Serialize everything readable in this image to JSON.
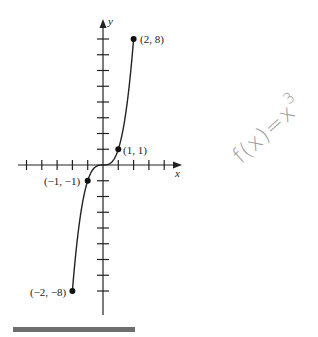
{
  "chart_data": {
    "type": "line",
    "title": "",
    "xlabel": "x",
    "ylabel": "y",
    "function": "f(x) = x^3",
    "domain": [
      -2,
      2
    ],
    "xlim": [
      -5.2,
      4.9
    ],
    "ylim": [
      -9.5,
      9.2
    ],
    "grid": false,
    "x_ticks": [
      -5,
      -4,
      -3,
      -2,
      -1,
      1,
      2,
      3,
      4
    ],
    "y_ticks": [
      -8,
      -7,
      -6,
      -5,
      -4,
      -3,
      -2,
      -1,
      1,
      2,
      3,
      4,
      5,
      6,
      7,
      8
    ],
    "series": [
      {
        "name": "f(x) = x^3",
        "x": [
          -2,
          -1.5,
          -1,
          -0.5,
          0,
          0.5,
          1,
          1.5,
          2
        ],
        "y": [
          -8,
          -3.375,
          -1,
          -0.125,
          0,
          0.125,
          1,
          3.375,
          8
        ]
      }
    ],
    "points": [
      {
        "x": 2,
        "y": 8,
        "label": "(2, 8)"
      },
      {
        "x": 1,
        "y": 1,
        "label": "(1, 1)"
      },
      {
        "x": -1,
        "y": -1,
        "label": "(−1, −1)"
      },
      {
        "x": -2,
        "y": -8,
        "label": "(−2, −8)"
      }
    ],
    "annotations": [
      {
        "text": "f(x)=x",
        "superscript": "3",
        "style": "handwritten pencil, rotated"
      }
    ]
  },
  "labels": {
    "x_axis": "x",
    "y_axis": "y",
    "p1": "(2, 8)",
    "p2": "(1, 1)",
    "p3": "(−1, −1)",
    "p4": "(−2, −8)",
    "handwritten": "f(x)=x",
    "handwritten_exp": "3"
  },
  "colors": {
    "ink": "#222222",
    "pencil": "#9a9a9a",
    "bar": "#6e6e6e"
  }
}
